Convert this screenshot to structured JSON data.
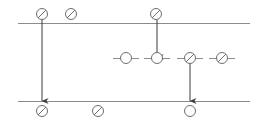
{
  "canvas": {
    "width": 266,
    "height": 126,
    "background": "#ffffff",
    "title": "timeline-token-diagram"
  },
  "style": {
    "line_color": "#8c8c8c",
    "node_stroke": "#6e6e6e",
    "arrow_color": "#3a3a3a",
    "node_fill": "#ffffff",
    "line_width": 1,
    "node_stroke_width": 1,
    "node_radius": 5.5
  },
  "chart_data": {
    "type": "diagram",
    "title": "",
    "xlabel": "",
    "ylabel": "",
    "lanes": [
      {
        "id": "lane-top",
        "label": "",
        "y": 23,
        "x1": 18,
        "x2": 250,
        "visible_rule": true
      },
      {
        "id": "lane-middle",
        "label": "",
        "y": 58,
        "x1": 0,
        "x2": 0,
        "visible_rule": false
      },
      {
        "id": "lane-bottom",
        "label": "",
        "y": 101,
        "x1": 18,
        "x2": 250,
        "visible_rule": true
      }
    ],
    "nodes": [
      {
        "id": "n1",
        "lane": "lane-top",
        "x": 42,
        "y": 14,
        "marker": "slashed-circle",
        "label": "",
        "tick": false
      },
      {
        "id": "n2",
        "lane": "lane-top",
        "x": 71,
        "y": 14,
        "marker": "slashed-circle",
        "label": "",
        "tick": false
      },
      {
        "id": "n3",
        "lane": "lane-top",
        "x": 156,
        "y": 14,
        "marker": "slashed-circle",
        "label": "",
        "tick": false
      },
      {
        "id": "n4",
        "lane": "lane-middle",
        "x": 126,
        "y": 58,
        "marker": "open-circle",
        "label": "",
        "tick": true
      },
      {
        "id": "n5",
        "lane": "lane-middle",
        "x": 157,
        "y": 58,
        "marker": "open-circle",
        "label": "",
        "tick": true
      },
      {
        "id": "n6",
        "lane": "lane-middle",
        "x": 190,
        "y": 58,
        "marker": "slashed-circle",
        "label": "",
        "tick": true
      },
      {
        "id": "n7",
        "lane": "lane-middle",
        "x": 222,
        "y": 58,
        "marker": "slashed-circle",
        "label": "",
        "tick": true
      },
      {
        "id": "n8",
        "lane": "lane-bottom",
        "x": 42,
        "y": 111,
        "marker": "slashed-circle",
        "label": "",
        "tick": false
      },
      {
        "id": "n9",
        "lane": "lane-bottom",
        "x": 98,
        "y": 111,
        "marker": "slashed-circle",
        "label": "",
        "tick": false
      },
      {
        "id": "n10",
        "lane": "lane-bottom",
        "x": 190,
        "y": 111,
        "marker": "open-circle",
        "label": "",
        "tick": false
      }
    ],
    "arrows": [
      {
        "id": "a1",
        "from": "n1",
        "to": "n8",
        "x": 42,
        "y1": 20,
        "y2": 101,
        "label": ""
      },
      {
        "id": "a2",
        "from": "n3",
        "to": "n5",
        "x": 157,
        "y1": 20,
        "y2": 57,
        "label": ""
      },
      {
        "id": "a3",
        "from": "n6",
        "to": "n10",
        "x": 190,
        "y1": 63,
        "y2": 101,
        "label": ""
      }
    ],
    "ticks": [
      {
        "id": "t1",
        "node": "n4",
        "x1": 113,
        "x2": 139,
        "y": 58
      },
      {
        "id": "t2",
        "node": "n5",
        "x1": 144,
        "x2": 170,
        "y": 58
      },
      {
        "id": "t3",
        "node": "n6",
        "x1": 177,
        "x2": 203,
        "y": 58
      },
      {
        "id": "t4",
        "node": "n7",
        "x1": 209,
        "x2": 235,
        "y": 58
      }
    ],
    "legend": [],
    "annotations": []
  }
}
